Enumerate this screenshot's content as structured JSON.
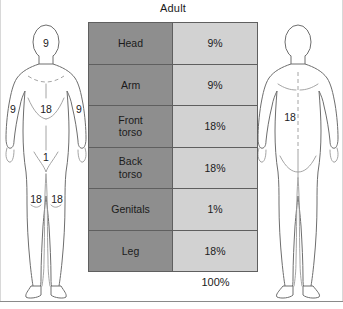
{
  "title": "Adult",
  "table": {
    "rows": [
      {
        "region": "Head",
        "percent": "9%"
      },
      {
        "region": "Arm",
        "percent": "9%"
      },
      {
        "region": "Front\ntorso",
        "percent": "18%"
      },
      {
        "region": "Back\ntorso",
        "percent": "18%"
      },
      {
        "region": "Genitals",
        "percent": "1%"
      },
      {
        "region": "Leg",
        "percent": "18%"
      }
    ],
    "total": "100%"
  },
  "anterior_figure": {
    "name": "anterior-body-diagram",
    "labels": {
      "head": "9",
      "arm_left": "9",
      "arm_right": "9",
      "front_torso": "18",
      "genitals": "1",
      "leg_left": "18",
      "leg_right": "18"
    }
  },
  "posterior_figure": {
    "name": "posterior-body-diagram",
    "labels": {
      "back_torso": "18"
    }
  },
  "colors": {
    "region_cell": "#8e8e8e",
    "percent_cell": "#d2d2d2",
    "grid_line": "#5f5f5f",
    "body_outline": "#6e6e6e",
    "text": "#1b1b1b"
  }
}
